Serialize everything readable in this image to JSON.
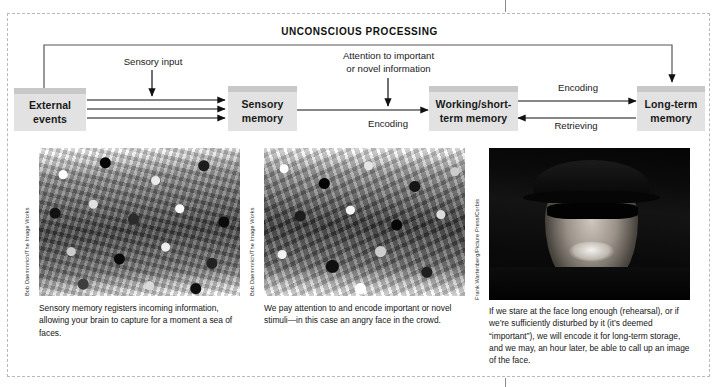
{
  "figure": {
    "header_title": "UNCONSCIOUS PROCESSING"
  },
  "flow": {
    "boxes": [
      {
        "id": "external-events",
        "label": "External\nevents"
      },
      {
        "id": "sensory-memory",
        "label": "Sensory\nmemory"
      },
      {
        "id": "working-short-term-memory",
        "label": "Working/short-\nterm memory"
      },
      {
        "id": "long-term-memory",
        "label": "Long-term\nmemory"
      }
    ],
    "labels": [
      {
        "id": "sensory-input",
        "text": "Sensory input"
      },
      {
        "id": "attention",
        "text": "Attention to important\nor novel information"
      },
      {
        "id": "encoding-sensory",
        "text": "Encoding"
      },
      {
        "id": "encoding-longterm",
        "text": "Encoding"
      },
      {
        "id": "retrieving",
        "text": "Retrieving"
      }
    ]
  },
  "panels": [
    {
      "id": "panel-sensory",
      "credit": "Bob Daemmrich/The Image Works",
      "caption": "Sensory memory registers incoming information, allowing your brain to capture for a moment a sea of faces.",
      "photo_alt": "black-and-white photo of a large crowd of spectators"
    },
    {
      "id": "panel-attention",
      "credit": "Bob Daemmrich/The Image Works",
      "caption": "We pay attention to and encode important or novel stimuli—in this case an angry face in the crowd.",
      "photo_alt": "black-and-white photo of a crowd with one man standing out"
    },
    {
      "id": "panel-longterm",
      "credit": "Frank Wartenberg/Picture Press/Corbis",
      "caption": "If we stare at the face long enough (rehearsal), or if we’re sufficiently disturbed by it (it’s deemed “important”), we will encode it for long-term storage, and we may, an hour later, be able to call up an image of the face.",
      "photo_alt": "close-up black-and-white photo of a shouting man wearing a cap and sunglasses"
    }
  ],
  "colors": {
    "box_fill": "#e2e2e2",
    "box_header": "#c8c8c8",
    "line": "#1a1a1a",
    "frame_dash": "#b9b9b9",
    "text": "#141414"
  }
}
